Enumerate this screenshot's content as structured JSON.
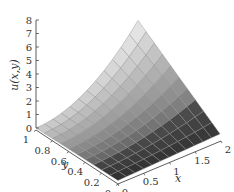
{
  "chart_data": {
    "type": "surface3d",
    "title": "",
    "xlabel": "x",
    "ylabel": "y",
    "zlabel": "u(x,y)",
    "xlim": [
      0,
      2
    ],
    "ylim": [
      0,
      1
    ],
    "zlim": [
      0,
      8
    ],
    "x_ticks": [
      "0",
      "0.5",
      "1",
      "1.5",
      "2"
    ],
    "y_ticks": [
      "0",
      "0.2",
      "0.4",
      "0.6",
      "0.8",
      "1"
    ],
    "z_ticks": [
      "0",
      "1",
      "2",
      "3",
      "4",
      "5",
      "6",
      "7",
      "8"
    ],
    "grid": false,
    "colormap": "grayscale",
    "mesh": {
      "nx": 12,
      "ny": 10
    },
    "surface_description": "u increases strongly with x and y; near 0 along x=0, peak about 8 at (x=2,y=1), low along y=0"
  }
}
